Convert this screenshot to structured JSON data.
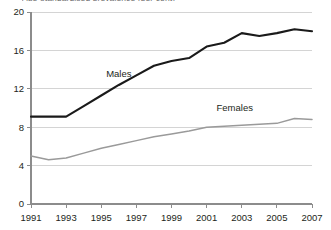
{
  "title_clipped": "Age-standardised prevalence (per cent)",
  "chart_data": {
    "type": "line",
    "title": "",
    "xlabel": "",
    "ylabel": "",
    "xlim": [
      1991,
      2007
    ],
    "ylim": [
      0,
      20
    ],
    "grid": true,
    "legend": "inline-labels",
    "x": [
      1991,
      1992,
      1993,
      1994,
      1995,
      1996,
      1997,
      1998,
      1999,
      2000,
      2001,
      2002,
      2003,
      2004,
      2005,
      2006,
      2007
    ],
    "xticks": [
      "1991",
      "1993",
      "1995",
      "1997",
      "1999",
      "2001",
      "2003",
      "2005",
      "2007"
    ],
    "yticks": [
      "0",
      "4",
      "8",
      "12",
      "16",
      "20"
    ],
    "series": [
      {
        "name": "Males",
        "color": "#1a1a1a",
        "width": 2.1,
        "label_x": 1996.0,
        "label_y": 13.2,
        "values": [
          9.1,
          9.1,
          9.1,
          10.2,
          11.3,
          12.4,
          13.4,
          14.4,
          14.9,
          15.2,
          16.4,
          16.8,
          17.8,
          17.5,
          17.8,
          18.2,
          18.0
        ]
      },
      {
        "name": "Females",
        "color": "#9a9a9a",
        "width": 1.5,
        "label_x": 2002.6,
        "label_y": 9.7,
        "values": [
          5.0,
          4.6,
          4.8,
          5.3,
          5.8,
          6.2,
          6.6,
          7.0,
          7.3,
          7.6,
          8.0,
          8.1,
          8.2,
          8.3,
          8.4,
          8.9,
          8.8
        ]
      }
    ]
  }
}
